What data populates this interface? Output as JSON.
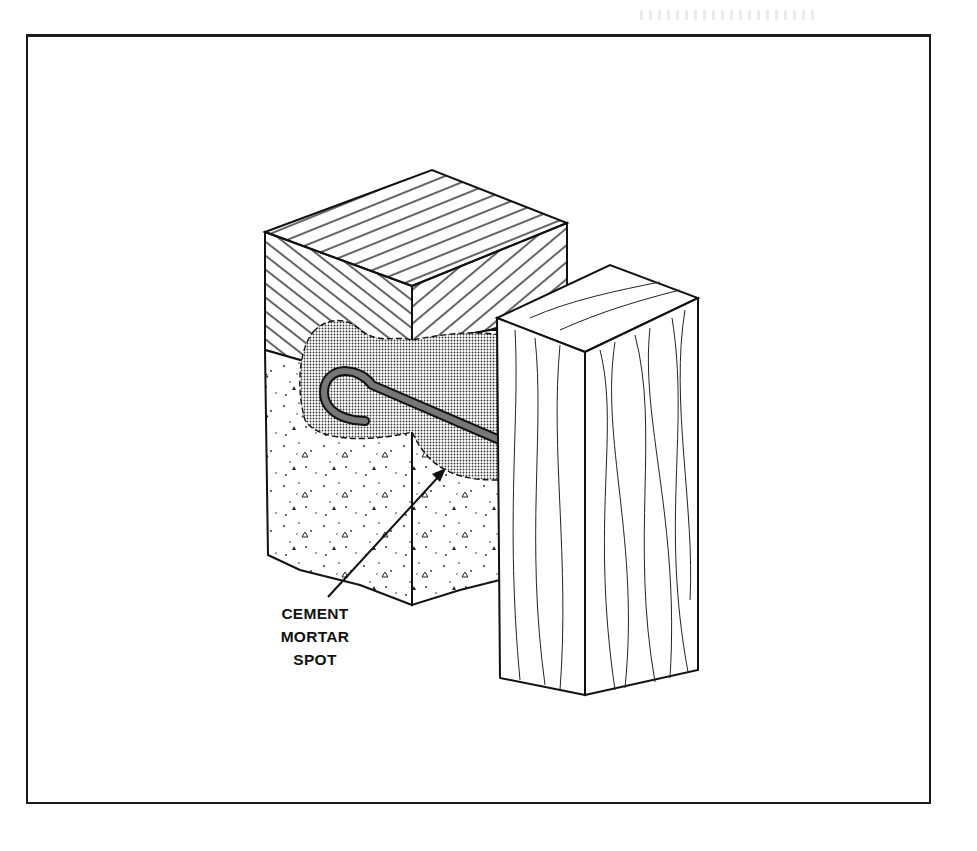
{
  "figure": {
    "callout": {
      "lines": [
        "CEMENT",
        "MORTAR",
        "SPOT"
      ]
    },
    "colors": {
      "ink": "#111111",
      "mortar_fill": "#cfcfcf",
      "bolt": "#6e6e6e",
      "background": "#ffffff"
    }
  }
}
